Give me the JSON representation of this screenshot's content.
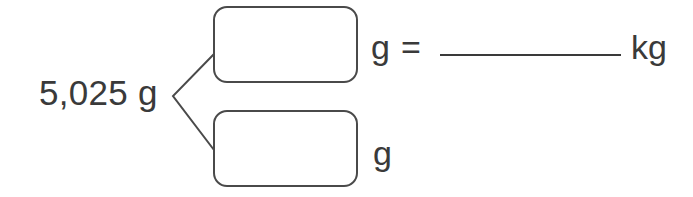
{
  "problem": {
    "total_value": "5,025 g",
    "top_part": {
      "box_value": "",
      "unit": "g"
    },
    "equals_sign": "=",
    "answer": {
      "blank_value": "",
      "unit": "kg"
    },
    "bottom_part": {
      "box_value": "",
      "unit": "g"
    }
  },
  "colors": {
    "text": "#3a3a3a",
    "stroke": "#4a4a4a",
    "background": "#ffffff"
  }
}
